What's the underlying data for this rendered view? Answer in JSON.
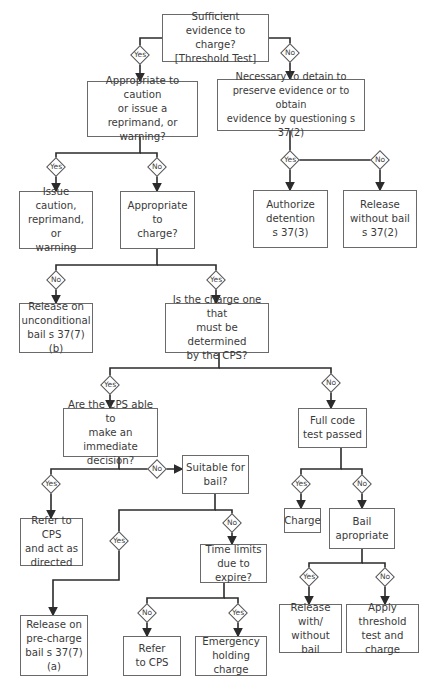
{
  "nodes": {
    "threshold": "Sufficient\nevidence to charge?\n[Threshold Test]",
    "caution_q": "Appropriate to caution\nor issue a reprimand, or\nwarning?",
    "detain_q": "Necessary to detain to\npreserve evidence or to obtain\nevidence by questioning s 37(2)",
    "issue_caution": "Issue caution,\nreprimand, or\nwarning",
    "charge_q": "Appropriate to\ncharge?",
    "authorize": "Authorize\ndetention\ns 37(3)",
    "release_no_bail": "Release\nwithout bail\ns 37(2)",
    "release_unconditional": "Release on\nunconditional\nbail s 37(7)(b)",
    "cps_determined_q": "Is the charge one that\nmust be determined\nby the CPS?",
    "cps_immediate_q": "Are the CPS able to\nmake an immediate\ndecision?",
    "full_code_q": "Full code\ntest passed",
    "suitable_bail_q": "Suitable for\nbail?",
    "refer_cps_act": "Refer to CPS\nand act as\ndirected",
    "charge": "Charge",
    "bail_appropriate_q": "Bail\napropriate",
    "time_limits_q": "Time limits\ndue to expire?",
    "release_precharge": "Release on\npre-charge\nbail s 37(7)(a)",
    "refer_cps": "Refer\nto CPS",
    "emergency": "Emergency\nholding charge",
    "release_with_without": "Release with/\nwithout\nbail",
    "apply_threshold": "Apply threshold\ntest and\ncharge"
  },
  "labels": {
    "yes": "Yes",
    "no": "No"
  },
  "colors": {
    "line": "#2b2b2b",
    "box_border": "#6a6a6a",
    "text": "#3a3a3a"
  }
}
